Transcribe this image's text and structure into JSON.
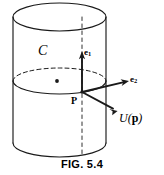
{
  "figure": {
    "caption": "FIG. 5.4",
    "background_color": "#ffffff",
    "stroke_color": "#1a1a1a",
    "labels": {
      "curve_c": "C",
      "e1_base": "e",
      "e1_subscript": "1",
      "e2_base": "e",
      "e2_subscript": "2",
      "point_p": "P",
      "vector_field_prefix": "U(",
      "vector_field_argument": "p",
      "vector_field_suffix": ")"
    },
    "geometry": {
      "cylinder": {
        "left_edge_x": 13,
        "right_edge_x": 106,
        "top_center_y": 17,
        "bottom_center_y": 143,
        "radius_x": 46.5,
        "radius_y": 14
      },
      "curve_c_ellipse": {
        "center_x": 59.5,
        "center_y": 81,
        "radius_x": 46.5,
        "radius_y": 13,
        "back_half_style": "dashed",
        "front_half_style": "solid"
      },
      "axis_dashed_line": {
        "x": 82,
        "y_top": 17,
        "y_bottom": 157
      },
      "center_dot": {
        "x": 57,
        "y": 81
      },
      "origin_point": {
        "x": 82,
        "y": 92
      },
      "vectors": [
        {
          "name": "e1",
          "to_x": 82,
          "to_y": 53
        },
        {
          "name": "e2",
          "to_x": 128,
          "to_y": 81
        },
        {
          "name": "U(p)",
          "to_x": 117,
          "to_y": 111
        }
      ]
    }
  }
}
